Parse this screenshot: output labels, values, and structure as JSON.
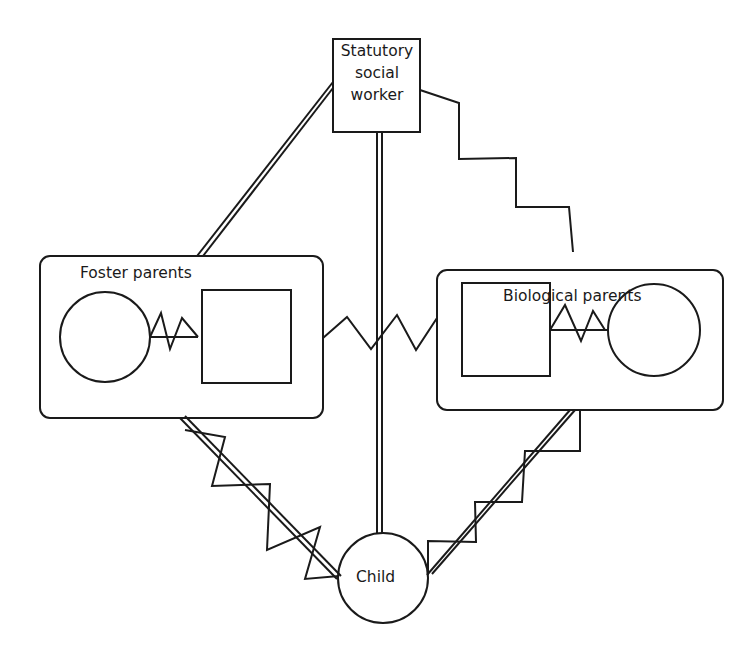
{
  "diagram": {
    "type": "family-relationship-diagram",
    "nodes": {
      "social_worker": {
        "label_lines": [
          "Statutory",
          "social",
          "worker"
        ],
        "shape": "square"
      },
      "foster_parents": {
        "label": "Foster parents",
        "members": [
          "female-circle",
          "male-square"
        ]
      },
      "biological_parents": {
        "label": "Biological parents",
        "members": [
          "male-square",
          "female-circle"
        ]
      },
      "child": {
        "label": "Child",
        "shape": "circle"
      }
    },
    "edges": [
      {
        "from": "social_worker",
        "to": "foster_parents",
        "style": "double-line"
      },
      {
        "from": "social_worker",
        "to": "child",
        "style": "double-line"
      },
      {
        "from": "social_worker",
        "to": "biological_parents",
        "style": "stepped-line"
      },
      {
        "from": "foster_parents",
        "to": "biological_parents",
        "style": "zigzag"
      },
      {
        "from": "foster_parents",
        "to": "child",
        "style": "double-line-with-zigzag"
      },
      {
        "from": "biological_parents",
        "to": "child",
        "style": "double-line-with-zigzag"
      },
      {
        "from": "foster_mother",
        "to": "foster_father",
        "style": "zigzag"
      },
      {
        "from": "biological_father",
        "to": "biological_mother",
        "style": "zigzag"
      }
    ],
    "line_color": "#1a1a1a"
  }
}
